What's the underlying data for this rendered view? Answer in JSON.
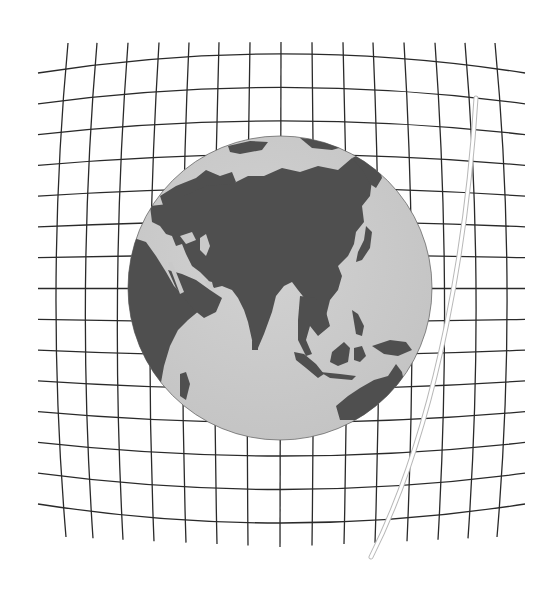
{
  "figure": {
    "title": "Spacetime grid curved around Earth with a light path",
    "description": "Pincushion-distorted coordinate grid behind a globe showing Asia, Africa and Australia, with a thin white curved tube to the right",
    "colors": {
      "background": "#ffffff",
      "grid": "#2a2a2a",
      "ocean": "#c9c9c9",
      "land": "#4f4f4f",
      "tube": "#ffffff",
      "tube_edge": "#b8b8b8"
    },
    "grid": {
      "horizontal_lines": 15,
      "vertical_lines": 15,
      "distortion": "pincushion",
      "left_x": 38,
      "right_x": 525,
      "edge_y_top": 73,
      "edge_y_bottom": 504,
      "vertical_top_x": [
        68,
        97,
        128,
        159,
        189,
        219,
        250,
        281,
        312,
        343,
        373,
        404,
        435,
        465,
        495
      ],
      "vertical_bottom_x": [
        66,
        93,
        123,
        154,
        186,
        217,
        248,
        280,
        312,
        344,
        375,
        407,
        438,
        468,
        497
      ]
    },
    "globe": {
      "center_x": 280,
      "center_y": 288,
      "radius": 152,
      "visible_regions": [
        "Europe",
        "Asia",
        "Africa (east)",
        "Arabian Peninsula",
        "India",
        "Southeast Asia",
        "Indonesia",
        "Australia (north)",
        "Japan"
      ]
    },
    "tube": {
      "start": [
        476,
        98
      ],
      "end": [
        371,
        557
      ]
    }
  }
}
